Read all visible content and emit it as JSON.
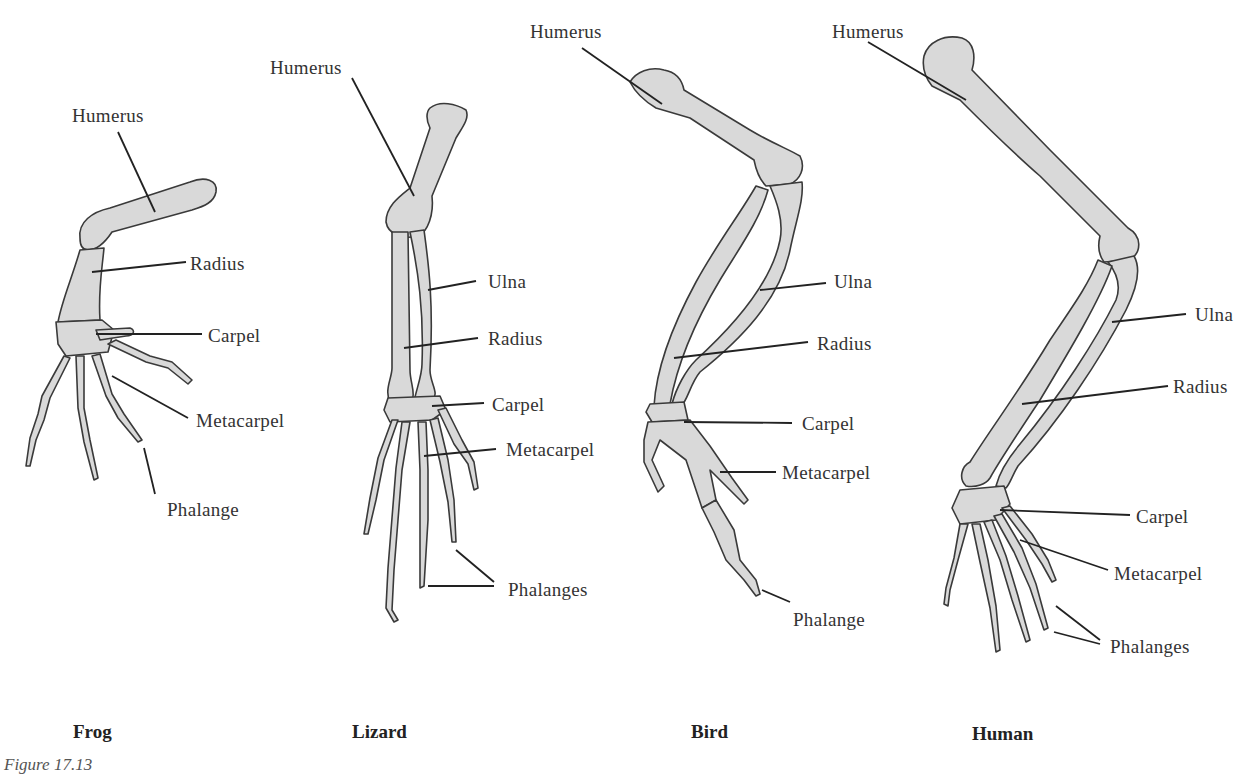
{
  "figure": {
    "caption": "Figure 17.13",
    "bone_color": "#d9d9d9",
    "outline_color": "#3a3a3a"
  },
  "limbs": [
    {
      "animal": "Frog",
      "labels": {
        "humerus": "Humerus",
        "radius": "Radius",
        "carpel": "Carpel",
        "metacarpel": "Metacarpel",
        "phalange": "Phalange"
      }
    },
    {
      "animal": "Lizard",
      "labels": {
        "humerus": "Humerus",
        "ulna": "Ulna",
        "radius": "Radius",
        "carpel": "Carpel",
        "metacarpel": "Metacarpel",
        "phalanges": "Phalanges"
      }
    },
    {
      "animal": "Bird",
      "labels": {
        "humerus": "Humerus",
        "ulna": "Ulna",
        "radius": "Radius",
        "carpel": "Carpel",
        "metacarpel": "Metacarpel",
        "phalange": "Phalange"
      }
    },
    {
      "animal": "Human",
      "labels": {
        "humerus": "Humerus",
        "ulna": "Ulna",
        "radius": "Radius",
        "carpel": "Carpel",
        "metacarpel": "Metacarpel",
        "phalanges": "Phalanges"
      }
    }
  ]
}
